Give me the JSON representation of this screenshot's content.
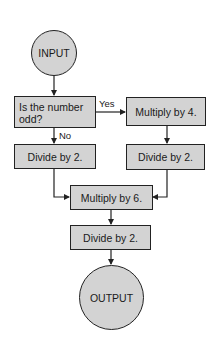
{
  "colors": {
    "node_fill": "#d3d3d3",
    "stroke": "#222222",
    "background": "#ffffff"
  },
  "nodes": {
    "input": {
      "label": "INPUT",
      "shape": "circle"
    },
    "decision": {
      "label": "Is the number odd?",
      "shape": "box"
    },
    "multiply4": {
      "label": "Multiply by 4.",
      "shape": "box"
    },
    "divide_left": {
      "label": "Divide by 2.",
      "shape": "box"
    },
    "divide_right": {
      "label": "Divide by 2.",
      "shape": "box"
    },
    "multiply6": {
      "label": "Multiply by 6.",
      "shape": "box"
    },
    "divide_bottom": {
      "label": "Divide by 2.",
      "shape": "box"
    },
    "output": {
      "label": "OUTPUT",
      "shape": "circle"
    }
  },
  "edges": {
    "yes_label": "Yes",
    "no_label": "No"
  }
}
